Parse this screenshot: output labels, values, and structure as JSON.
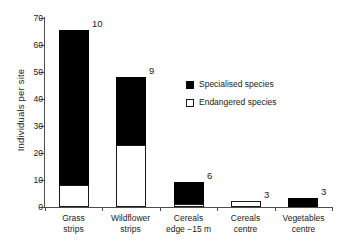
{
  "chart_data": {
    "type": "bar",
    "subtype": "stacked-bar",
    "title": "",
    "xlabel": "",
    "ylabel": "Individuals per site",
    "ylim": [
      0,
      70
    ],
    "yticks": [
      0,
      10,
      20,
      30,
      40,
      50,
      60,
      70
    ],
    "ytick_labels": [
      "0",
      "10",
      "20",
      "30",
      "40",
      "50",
      "60",
      "70"
    ],
    "grid": false,
    "legend_position": "inside-right",
    "categories": [
      "Grass\nstrips",
      "Wildflower\nstrips",
      "Cereals\nedge −15 m",
      "Cereals\ncentre",
      "Vegetables\ncentre"
    ],
    "series": [
      {
        "name": "Endangered species",
        "color": "#ffffff",
        "values": [
          8,
          23,
          1,
          2.1,
          0
        ]
      },
      {
        "name": "Specialised species",
        "color": "#000000",
        "values": [
          57.5,
          25,
          8.3,
          0,
          3.4
        ]
      }
    ],
    "totals": [
      65.5,
      48,
      9.3,
      2.1,
      3.4
    ],
    "bar_annotations": [
      "10",
      "9",
      "6",
      "3",
      "3"
    ],
    "annotation_note": "Number above each bar is the species count"
  },
  "legend": {
    "items": [
      {
        "label": "Specialised species",
        "swatch": "filled-black-square"
      },
      {
        "label": "Endangered species",
        "swatch": "open-white-square"
      }
    ]
  },
  "axes": {
    "y_title": "Individuals per site"
  }
}
